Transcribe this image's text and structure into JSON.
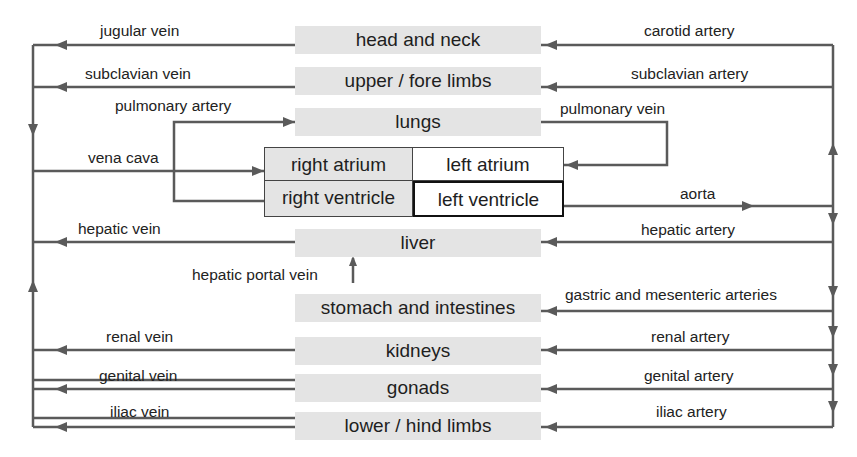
{
  "diagram": {
    "title": "",
    "colors": {
      "line": "#5a5a5a",
      "organ_fill": "#e4e4e4",
      "text": "#1e1e1e"
    },
    "organs": [
      {
        "id": "head-and-neck",
        "label": "head and neck"
      },
      {
        "id": "upper-fore-limbs",
        "label": "upper / fore limbs"
      },
      {
        "id": "lungs",
        "label": "lungs"
      },
      {
        "id": "liver",
        "label": "liver"
      },
      {
        "id": "stomach-and-intestines",
        "label": "stomach and intestines"
      },
      {
        "id": "kidneys",
        "label": "kidneys"
      },
      {
        "id": "gonads",
        "label": "gonads"
      },
      {
        "id": "lower-hind-limbs",
        "label": "lower / hind limbs"
      }
    ],
    "heart": {
      "right_atrium": "right atrium",
      "left_atrium": "left atrium",
      "right_ventricle": "right ventricle",
      "left_ventricle": "left ventricle"
    },
    "veins": [
      {
        "id": "jugular-vein",
        "label": "jugular vein"
      },
      {
        "id": "subclavian-vein",
        "label": "subclavian vein"
      },
      {
        "id": "pulmonary-artery",
        "label": "pulmonary artery"
      },
      {
        "id": "vena-cava",
        "label": "vena cava"
      },
      {
        "id": "hepatic-vein",
        "label": "hepatic vein"
      },
      {
        "id": "hepatic-portal-vein",
        "label": "hepatic portal vein"
      },
      {
        "id": "renal-vein",
        "label": "renal vein"
      },
      {
        "id": "genital-vein",
        "label": "genital vein"
      },
      {
        "id": "iliac-vein",
        "label": "iliac vein"
      }
    ],
    "arteries": [
      {
        "id": "carotid-artery",
        "label": "carotid artery"
      },
      {
        "id": "subclavian-artery",
        "label": "subclavian artery"
      },
      {
        "id": "pulmonary-vein",
        "label": "pulmonary vein"
      },
      {
        "id": "aorta",
        "label": "aorta"
      },
      {
        "id": "hepatic-artery",
        "label": "hepatic artery"
      },
      {
        "id": "gastric-and-mesenteric-arteries",
        "label": "gastric and mesenteric arteries"
      },
      {
        "id": "renal-artery",
        "label": "renal artery"
      },
      {
        "id": "genital-artery",
        "label": "genital artery"
      },
      {
        "id": "iliac-artery",
        "label": "iliac artery"
      }
    ]
  }
}
